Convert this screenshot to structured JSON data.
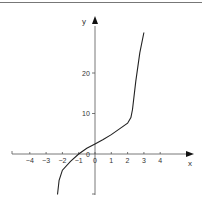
{
  "chart_data": {
    "type": "line",
    "title": "",
    "xlabel": "x",
    "ylabel": "y",
    "xlim": [
      -4.8,
      5.8
    ],
    "ylim": [
      -10,
      30
    ],
    "grid": false,
    "legend": null,
    "x_ticks": [
      "-4",
      "-3",
      "-2",
      "-1",
      "0",
      "1",
      "2",
      "3",
      "4"
    ],
    "y_ticks": [
      "0",
      "10",
      "20"
    ],
    "series": [
      {
        "name": "curve",
        "x": [
          -2.3,
          -2.2,
          -2.0,
          -1.5,
          -1.0,
          -0.5,
          0,
          0.5,
          1.0,
          1.5,
          2.0,
          2.2,
          2.3,
          2.5,
          2.75,
          3.0
        ],
        "y": [
          -10,
          -6.5,
          -4,
          -1.8,
          0,
          1.4,
          2.5,
          3.6,
          4.8,
          6.2,
          7.6,
          9,
          11,
          18,
          25,
          30
        ]
      }
    ]
  },
  "axes": {
    "x_label": "x",
    "y_label": "y",
    "origin_label": "0",
    "x_tick_labels": [
      "-4",
      "-3",
      "-2",
      "-1",
      "0",
      "1",
      "2",
      "3",
      "4"
    ],
    "y_tick_labels": [
      "10",
      "20"
    ]
  }
}
